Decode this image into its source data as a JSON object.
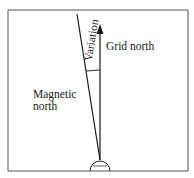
{
  "diagram": {
    "labels": {
      "variation": "Variation",
      "grid_north": "Grid north",
      "magnetic_north_line1": "Magnetic",
      "magnetic_north_line2": "north"
    },
    "colors": {
      "line": "#1a1a1a",
      "frame": "#555555",
      "background": "#ffffff"
    }
  }
}
